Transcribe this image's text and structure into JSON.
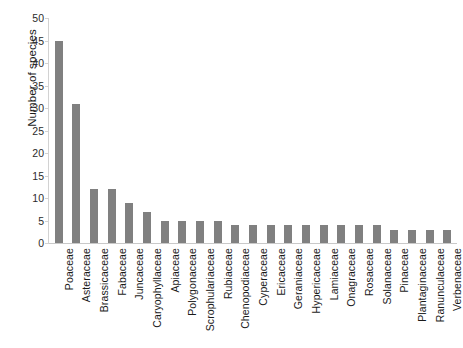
{
  "chart_data": {
    "type": "bar",
    "title": "",
    "subtitle": "",
    "xlabel": "",
    "ylabel": "Number of species",
    "ylim": [
      0,
      50
    ],
    "yticks": [
      0,
      5,
      10,
      15,
      20,
      25,
      30,
      35,
      40,
      45,
      50
    ],
    "grid": false,
    "legend": null,
    "bar_color": "#808080",
    "categories": [
      "Poaceae",
      "Asteraceae",
      "Brassicaceae",
      "Fabaceae",
      "Juncaceae",
      "Caryophyllaceae",
      "Apiaceae",
      "Polygonaceae",
      "Scrophulariaceae",
      "Rubiaceae",
      "Chenopodiaceae",
      "Cyperaceae",
      "Ericaceae",
      "Geraniaceae",
      "Hypericaceae",
      "Lamiaceae",
      "Onagraceae",
      "Rosaceae",
      "Solanaceae",
      "Pinaceae",
      "Plantaginaceae",
      "Ranunculaceae",
      "Verbenaceae"
    ],
    "values": [
      45,
      31,
      12,
      12,
      9,
      7,
      5,
      5,
      5,
      5,
      4,
      4,
      4,
      4,
      4,
      4,
      4,
      4,
      4,
      3,
      3,
      3,
      3
    ]
  }
}
